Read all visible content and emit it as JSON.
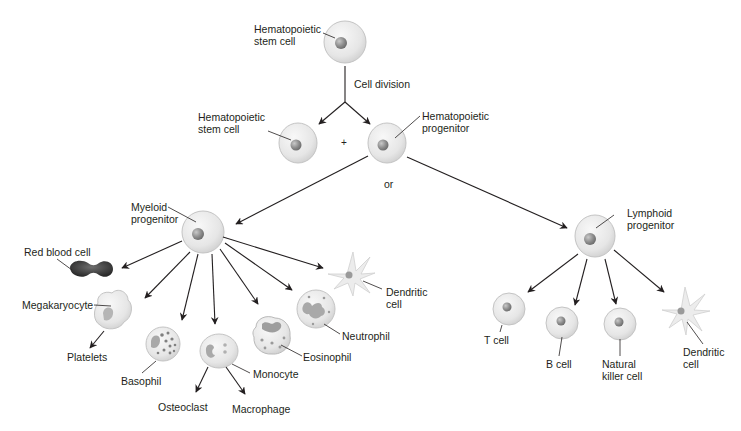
{
  "diagram": {
    "type": "hematopoiesis-lineage-tree",
    "labels": {
      "hsc_top": "Hematopoietic\nstem cell",
      "cell_division": "Cell division",
      "hsc_left": "Hematopoietic\nstem cell",
      "plus": "+",
      "hp": "Hematopoietic\nprogenitor",
      "or": "or",
      "myeloid": "Myeloid\nprogenitor",
      "lymphoid": "Lymphoid\nprogenitor",
      "rbc": "Red blood cell",
      "megakaryocyte": "Megakaryocyte",
      "platelets": "Platelets",
      "basophil": "Basophil",
      "monocyte": "Monocyte",
      "osteoclast": "Osteoclast",
      "macrophage": "Macrophage",
      "eosinophil": "Eosinophil",
      "neutrophil": "Neutrophil",
      "dendritic_myeloid": "Dendritic\ncell",
      "t_cell": "T cell",
      "b_cell": "B cell",
      "nk_cell": "Natural\nkiller cell",
      "dendritic_lymphoid": "Dendritic\ncell"
    },
    "colors": {
      "cell_fill": "#e9e9e9",
      "cell_edge": "#bdbdbd",
      "nucleus": "#8a8a8a",
      "rbc": "#3d3d3d",
      "arrow": "#231f20"
    }
  }
}
